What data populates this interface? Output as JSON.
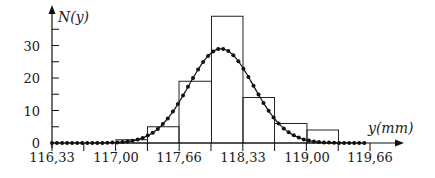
{
  "chart_data": {
    "type": "bar",
    "subtype": "histogram_with_fitted_normal_curve",
    "title": "",
    "xlabel": "y(mm)",
    "ylabel": "N(y)",
    "x_ticks": [
      "116,33",
      "117,00",
      "117,66",
      "118,33",
      "119,00",
      "119,66"
    ],
    "x_tick_values": [
      116.33,
      117.0,
      117.66,
      118.33,
      119.0,
      119.66
    ],
    "y_ticks": [
      "0",
      "10",
      "20",
      "30"
    ],
    "y_tick_values": [
      0,
      10,
      20,
      30
    ],
    "y_minor_step": 5,
    "xlim": [
      116.33,
      119.9
    ],
    "ylim": [
      0,
      42
    ],
    "grid": false,
    "legend": null,
    "bins": [
      {
        "from": 117.0,
        "to": 117.33,
        "count": 1
      },
      {
        "from": 117.33,
        "to": 117.66,
        "count": 5
      },
      {
        "from": 117.66,
        "to": 118.0,
        "count": 19
      },
      {
        "from": 118.0,
        "to": 118.33,
        "count": 39
      },
      {
        "from": 118.33,
        "to": 118.66,
        "count": 14
      },
      {
        "from": 118.66,
        "to": 119.0,
        "count": 6
      },
      {
        "from": 119.0,
        "to": 119.33,
        "count": 4
      }
    ],
    "series": [
      {
        "name": "histogram",
        "type": "bar",
        "values": [
          1,
          5,
          19,
          39,
          14,
          6,
          4
        ]
      },
      {
        "name": "fitted normal",
        "type": "line",
        "marker": "dot",
        "mean": 118.1,
        "peak": 29,
        "sigma": 0.34,
        "x_range": [
          116.33,
          119.6
        ]
      }
    ]
  },
  "labels": {
    "y_axis": "N(y)",
    "x_axis": "y(mm)"
  }
}
